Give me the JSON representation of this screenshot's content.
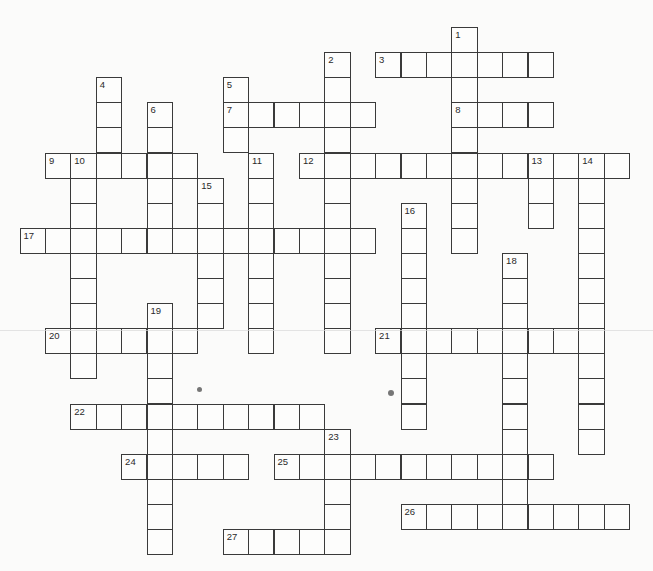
{
  "puzzle": {
    "type": "crossword",
    "grid": {
      "origin_x": 19.5,
      "origin_y": 27,
      "cell_w": 25.4,
      "cell_h": 25.1,
      "cols": 25,
      "rows": 21
    },
    "colors": {
      "background": "#fbfbfa",
      "cell_border": "#3a3a3a",
      "number_text": "#2a2a2a"
    },
    "across": [
      {
        "number": "3",
        "row": 1,
        "col": 14,
        "length": 7
      },
      {
        "number": "7",
        "row": 3,
        "col": 8,
        "length": 6
      },
      {
        "number": "8",
        "row": 3,
        "col": 17,
        "length": 4
      },
      {
        "number": "9",
        "row": 5,
        "col": 1,
        "length": 6
      },
      {
        "number": "12",
        "row": 5,
        "col": 11,
        "length": 13
      },
      {
        "number": "17",
        "row": 8,
        "col": 0,
        "length": 14
      },
      {
        "number": "20",
        "row": 12,
        "col": 1,
        "length": 6
      },
      {
        "number": "21",
        "row": 12,
        "col": 14,
        "length": 9
      },
      {
        "number": "22",
        "row": 15,
        "col": 2,
        "length": 10
      },
      {
        "number": "24",
        "row": 17,
        "col": 4,
        "length": 5
      },
      {
        "number": "25",
        "row": 17,
        "col": 10,
        "length": 11
      },
      {
        "number": "26",
        "row": 19,
        "col": 15,
        "length": 9
      },
      {
        "number": "27",
        "row": 20,
        "col": 8,
        "length": 5
      }
    ],
    "down": [
      {
        "number": "1",
        "row": 0,
        "col": 17,
        "length": 9
      },
      {
        "number": "2",
        "row": 1,
        "col": 12,
        "length": 12
      },
      {
        "number": "4",
        "row": 2,
        "col": 3,
        "length": 4
      },
      {
        "number": "5",
        "row": 2,
        "col": 8,
        "length": 3
      },
      {
        "number": "6",
        "row": 3,
        "col": 5,
        "length": 6
      },
      {
        "number": "10",
        "row": 5,
        "col": 2,
        "length": 9
      },
      {
        "number": "11",
        "row": 5,
        "col": 9,
        "length": 8
      },
      {
        "number": "13",
        "row": 5,
        "col": 20,
        "length": 3
      },
      {
        "number": "14",
        "row": 5,
        "col": 22,
        "length": 12
      },
      {
        "number": "15",
        "row": 6,
        "col": 7,
        "length": 6
      },
      {
        "number": "16",
        "row": 7,
        "col": 15,
        "length": 9
      },
      {
        "number": "18",
        "row": 9,
        "col": 19,
        "length": 11
      },
      {
        "number": "19",
        "row": 11,
        "col": 5,
        "length": 10
      },
      {
        "number": "23",
        "row": 16,
        "col": 12,
        "length": 5
      }
    ],
    "specks": [
      {
        "x": 199,
        "y": 389,
        "size": 5
      },
      {
        "x": 391,
        "y": 393,
        "size": 6
      }
    ]
  }
}
